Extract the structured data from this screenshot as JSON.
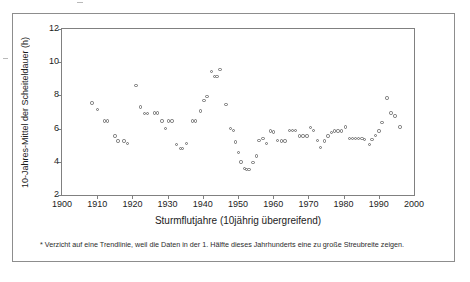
{
  "figure": {
    "footnote": "* Verzicht auf eine Trendlinie, weil die Daten in der 1. Hälfte dieses Jahrhunderts eine zu große Streubreite zeigen."
  },
  "chart_data": {
    "type": "scatter",
    "title": "",
    "xlabel": "Sturmflutjahre (10jährig übergreifend)",
    "ylabel": "10-Jahres-Mittel der Scheiteldauer (h)",
    "xlim": [
      1900,
      2000
    ],
    "ylim": [
      2,
      12
    ],
    "xticks": [
      1900,
      1910,
      1920,
      1930,
      1940,
      1950,
      1960,
      1970,
      1980,
      1990,
      2000
    ],
    "yticks": [
      2,
      4,
      6,
      8,
      10,
      12
    ],
    "grid": false,
    "legend": null,
    "marker": "open-circle",
    "marker_color": "#6f6f6f",
    "series": [
      {
        "name": "10-Jahres-Mittel der Scheiteldauer",
        "points": [
          [
            1908.5,
            7.55
          ],
          [
            1910.0,
            7.15
          ],
          [
            1912.0,
            6.45
          ],
          [
            1912.9,
            6.45
          ],
          [
            1915.0,
            5.55
          ],
          [
            1915.9,
            5.25
          ],
          [
            1917.6,
            5.25
          ],
          [
            1918.6,
            5.1
          ],
          [
            1921.0,
            8.6
          ],
          [
            1922.3,
            7.3
          ],
          [
            1923.4,
            6.9
          ],
          [
            1924.3,
            6.9
          ],
          [
            1926.2,
            6.95
          ],
          [
            1927.1,
            6.95
          ],
          [
            1928.4,
            6.45
          ],
          [
            1929.4,
            6.0
          ],
          [
            1930.3,
            6.45
          ],
          [
            1931.2,
            6.45
          ],
          [
            1932.6,
            5.05
          ],
          [
            1933.6,
            4.8
          ],
          [
            1934.3,
            4.8
          ],
          [
            1935.4,
            5.1
          ],
          [
            1937.0,
            6.45
          ],
          [
            1937.9,
            6.45
          ],
          [
            1939.4,
            7.05
          ],
          [
            1940.3,
            7.7
          ],
          [
            1941.2,
            7.95
          ],
          [
            1942.4,
            9.45
          ],
          [
            1943.3,
            9.15
          ],
          [
            1944.0,
            9.15
          ],
          [
            1944.9,
            9.55
          ],
          [
            1946.6,
            7.45
          ],
          [
            1947.9,
            6.0
          ],
          [
            1948.7,
            5.9
          ],
          [
            1949.3,
            5.2
          ],
          [
            1950.1,
            4.55
          ],
          [
            1950.9,
            4.0
          ],
          [
            1951.8,
            3.6
          ],
          [
            1952.4,
            3.55
          ],
          [
            1953.1,
            3.55
          ],
          [
            1954.3,
            3.95
          ],
          [
            1955.2,
            4.35
          ],
          [
            1956.0,
            5.3
          ],
          [
            1957.1,
            5.4
          ],
          [
            1958.1,
            5.1
          ],
          [
            1959.2,
            5.85
          ],
          [
            1960.0,
            5.8
          ],
          [
            1961.2,
            5.3
          ],
          [
            1962.3,
            5.25
          ],
          [
            1963.4,
            5.25
          ],
          [
            1964.6,
            5.9
          ],
          [
            1965.5,
            5.9
          ],
          [
            1966.4,
            5.9
          ],
          [
            1967.4,
            5.55
          ],
          [
            1968.5,
            5.55
          ],
          [
            1969.6,
            5.55
          ],
          [
            1970.6,
            6.05
          ],
          [
            1971.4,
            5.9
          ],
          [
            1972.5,
            5.3
          ],
          [
            1973.5,
            4.85
          ],
          [
            1974.6,
            5.25
          ],
          [
            1975.6,
            5.55
          ],
          [
            1976.5,
            5.75
          ],
          [
            1977.4,
            5.85
          ],
          [
            1978.4,
            5.85
          ],
          [
            1979.4,
            5.85
          ],
          [
            1980.6,
            6.1
          ],
          [
            1981.6,
            5.4
          ],
          [
            1982.5,
            5.4
          ],
          [
            1983.4,
            5.4
          ],
          [
            1984.3,
            5.4
          ],
          [
            1985.2,
            5.4
          ],
          [
            1986.0,
            5.35
          ],
          [
            1987.3,
            5.05
          ],
          [
            1988.1,
            5.35
          ],
          [
            1989.1,
            5.6
          ],
          [
            1990.1,
            5.85
          ],
          [
            1990.9,
            6.35
          ],
          [
            1992.3,
            7.85
          ],
          [
            1993.5,
            6.95
          ],
          [
            1994.6,
            6.75
          ],
          [
            1996.0,
            6.1
          ]
        ]
      }
    ]
  }
}
